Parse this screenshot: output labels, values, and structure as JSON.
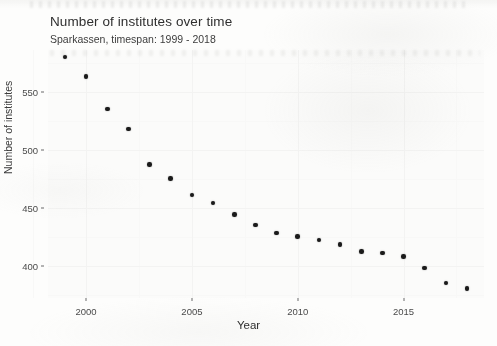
{
  "chart_data": {
    "type": "scatter",
    "title": "Number of institutes over time",
    "subtitle": "Sparkassen, timespan: 1999 - 2018",
    "xlabel": "Year",
    "ylabel": "Number of institutes",
    "grid": true,
    "legend": "none",
    "xlim": [
      1998.2,
      2018.8
    ],
    "ylim": [
      372,
      586
    ],
    "x_ticks": [
      2000,
      2005,
      2010,
      2015
    ],
    "y_ticks": [
      400,
      450,
      500,
      550
    ],
    "x": [
      1999,
      2000,
      2001,
      2002,
      2003,
      2004,
      2005,
      2006,
      2007,
      2008,
      2009,
      2010,
      2011,
      2012,
      2013,
      2014,
      2015,
      2016,
      2017,
      2018
    ],
    "values": [
      580,
      563,
      535,
      518,
      487,
      475,
      461,
      454,
      444,
      435,
      428,
      425,
      422,
      418,
      412,
      411,
      408,
      398,
      385,
      380
    ],
    "point_color": "#1a1a1a",
    "panel_color": "#fbfbfa",
    "grid_color": "#f3f3f2"
  }
}
